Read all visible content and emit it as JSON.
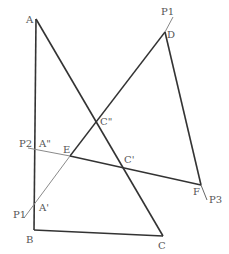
{
  "diagram": {
    "colors": {
      "line_dark": "#333333",
      "line_gray": "#8a8a8a",
      "label": "#555555",
      "background": "#ffffff"
    },
    "points": {
      "A": {
        "label": "A",
        "x": 36,
        "y": 19
      },
      "B": {
        "label": "B",
        "x": 34,
        "y": 230
      },
      "C": {
        "label": "C",
        "x": 163,
        "y": 236
      },
      "D": {
        "label": "D",
        "x": 165,
        "y": 32
      },
      "C2": {
        "label": "C\"",
        "x": 96,
        "y": 124
      },
      "E": {
        "label": "E",
        "x": 70,
        "y": 156
      },
      "C1": {
        "label": "C'",
        "x": 123,
        "y": 165
      },
      "A2": {
        "label": "A\"",
        "x": 35,
        "y": 152
      },
      "A1": {
        "label": "A'",
        "x": 35,
        "y": 202
      },
      "F": {
        "label": "F",
        "x": 201,
        "y": 185
      }
    },
    "line_labels": {
      "P1_top": "P1",
      "P1_bottom": "P1",
      "P2": "P2",
      "P3": "P3"
    }
  }
}
